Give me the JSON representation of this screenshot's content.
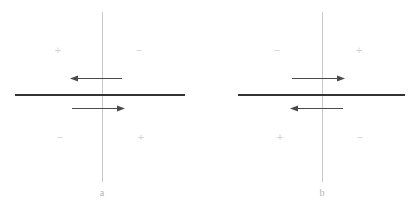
{
  "figure": {
    "width": 413,
    "height": 212,
    "background": "#ffffff",
    "axis_color": "#c9c9c9",
    "bar_color": "#333333",
    "arrow_color": "#4a4a4a",
    "sign_color": "#d2d2d2",
    "label_color": "#b4b4b4"
  },
  "panels": [
    {
      "id": "a",
      "label": "a",
      "label_x": 102,
      "label_y": 188,
      "axis": {
        "x": 102,
        "y_top": 12,
        "y_bottom": 182
      },
      "bar": {
        "x_start": 15,
        "x_end": 185,
        "y": 94
      },
      "arrows": [
        {
          "name": "upper-arrow",
          "direction": "left",
          "x_start": 70,
          "x_end": 122,
          "y": 78
        },
        {
          "name": "lower-arrow",
          "direction": "right",
          "x_start": 72,
          "x_end": 125,
          "y": 108
        }
      ],
      "quadrant_signs": [
        {
          "quadrant": "upper-left",
          "symbol": "+",
          "x": 58,
          "y": 45
        },
        {
          "quadrant": "upper-right",
          "symbol": "−",
          "x": 139,
          "y": 45
        },
        {
          "quadrant": "lower-left",
          "symbol": "−",
          "x": 60,
          "y": 132
        },
        {
          "quadrant": "lower-right",
          "symbol": "+",
          "x": 141,
          "y": 132
        }
      ]
    },
    {
      "id": "b",
      "label": "b",
      "label_x": 322,
      "label_y": 188,
      "axis": {
        "x": 322,
        "y_top": 12,
        "y_bottom": 182
      },
      "bar": {
        "x_start": 238,
        "x_end": 405,
        "y": 94
      },
      "arrows": [
        {
          "name": "upper-arrow",
          "direction": "right",
          "x_start": 292,
          "x_end": 345,
          "y": 78
        },
        {
          "name": "lower-arrow",
          "direction": "left",
          "x_start": 290,
          "x_end": 343,
          "y": 108
        }
      ],
      "quadrant_signs": [
        {
          "quadrant": "upper-left",
          "symbol": "−",
          "x": 277,
          "y": 45
        },
        {
          "quadrant": "upper-right",
          "symbol": "+",
          "x": 359,
          "y": 45
        },
        {
          "quadrant": "lower-left",
          "symbol": "+",
          "x": 280,
          "y": 132
        },
        {
          "quadrant": "lower-right",
          "symbol": "−",
          "x": 360,
          "y": 132
        }
      ]
    }
  ]
}
